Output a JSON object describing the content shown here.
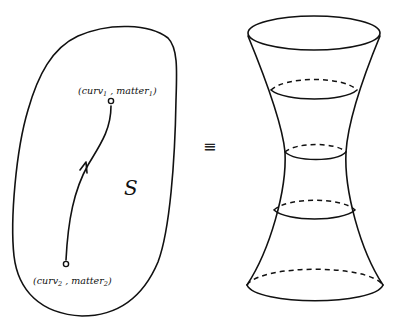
{
  "diagram": {
    "left_panel": {
      "region_label": "S",
      "point_top": {
        "base": "(curv",
        "sub1": "1",
        "mid": " , matter",
        "sub2": "1",
        "end": ")"
      },
      "point_bottom": {
        "base": "(curv",
        "sub1": "2",
        "mid": " , matter",
        "sub2": "2",
        "end": ")"
      }
    },
    "equivalence_symbol": "≡",
    "right_panel": {
      "shape": "hyperboloid-of-one-sheet",
      "cross_sections": 5
    }
  }
}
